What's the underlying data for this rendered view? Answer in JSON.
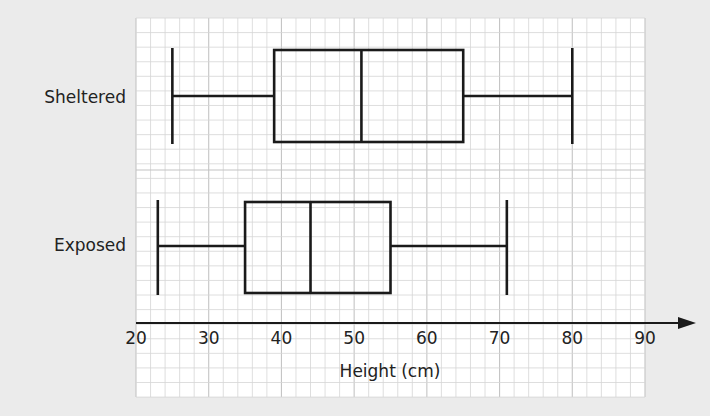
{
  "chart_data": {
    "type": "boxplot",
    "title": "",
    "orientation": "horizontal",
    "xlabel": "Height (cm)",
    "ylabel": "",
    "xlim": [
      20,
      90
    ],
    "x_ticks": [
      20,
      30,
      40,
      50,
      60,
      70,
      80,
      90
    ],
    "grid": true,
    "grid_minor_step": 2,
    "categories": [
      "Sheltered",
      "Exposed"
    ],
    "series": [
      {
        "name": "Sheltered",
        "min": 25,
        "q1": 39,
        "median": 51,
        "q3": 65,
        "max": 80
      },
      {
        "name": "Exposed",
        "min": 23,
        "q1": 35,
        "median": 44,
        "q3": 55,
        "max": 71
      }
    ]
  },
  "labels": {
    "sheltered": "Sheltered",
    "exposed": "Exposed",
    "xlabel": "Height (cm)",
    "ticks": [
      "20",
      "30",
      "40",
      "50",
      "60",
      "70",
      "80",
      "90"
    ]
  },
  "colors": {
    "background": "#ebebeb",
    "grid_bg": "#ffffff",
    "grid_line": "#d6d6d6",
    "grid_major": "#c4c4c4",
    "ink": "#1a1a1a"
  }
}
